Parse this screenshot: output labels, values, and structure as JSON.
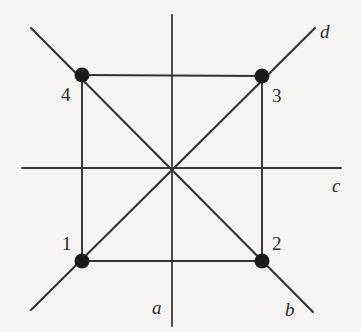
{
  "figure": {
    "background_color": "#f6f5f3",
    "line_color": "#333333",
    "node_color": "#1a1a1a",
    "label_color": "#2b2b2b",
    "width": 361,
    "height": 332,
    "center": {
      "x": 172,
      "y": 168
    }
  },
  "nodes": [
    {
      "id": "1",
      "label": "1",
      "x": 82,
      "y": 261,
      "label_x": 62,
      "label_y": 234,
      "radius": 7
    },
    {
      "id": "2",
      "label": "2",
      "x": 262,
      "y": 261,
      "label_x": 272,
      "label_y": 234,
      "radius": 7
    },
    {
      "id": "3",
      "label": "3",
      "x": 262,
      "y": 76,
      "label_x": 272,
      "label_y": 86,
      "radius": 7
    },
    {
      "id": "4",
      "label": "4",
      "x": 82,
      "y": 75,
      "label_x": 61,
      "label_y": 85,
      "radius": 7
    }
  ],
  "axis_labels": [
    {
      "id": "a",
      "label": "a",
      "x": 152,
      "y": 298
    },
    {
      "id": "b",
      "label": "b",
      "x": 285,
      "y": 300
    },
    {
      "id": "c",
      "label": "c",
      "x": 332,
      "y": 176
    },
    {
      "id": "d",
      "label": "d",
      "x": 320,
      "y": 22
    }
  ],
  "edges": [
    {
      "name": "square-top",
      "x1": 82,
      "y1": 75,
      "x2": 262,
      "y2": 76
    },
    {
      "name": "square-bottom",
      "x1": 82,
      "y1": 261,
      "x2": 262,
      "y2": 261
    },
    {
      "name": "square-left",
      "x1": 82,
      "y1": 75,
      "x2": 82,
      "y2": 261
    },
    {
      "name": "square-right",
      "x1": 262,
      "y1": 76,
      "x2": 262,
      "y2": 261
    }
  ],
  "axes": [
    {
      "name": "vertical-axis-a",
      "x1": 172,
      "y1": 15,
      "x2": 172,
      "y2": 326
    },
    {
      "name": "horizontal-axis-c",
      "x1": 22,
      "y1": 168,
      "x2": 341,
      "y2": 168
    },
    {
      "name": "diagonal-axis-d",
      "x1": 31,
      "y1": 28,
      "x2": 315,
      "y2": 28
    },
    {
      "name": "diagonal-axis-b",
      "x1": 31,
      "y1": 310,
      "x2": 313,
      "y2": 312
    }
  ],
  "diagonals": [
    {
      "name": "diagonal-4-to-2",
      "x1": 31,
      "y1": 28,
      "x2": 313,
      "y2": 312
    },
    {
      "name": "diagonal-1-to-3",
      "x1": 31,
      "y1": 310,
      "x2": 315,
      "y2": 28
    }
  ]
}
